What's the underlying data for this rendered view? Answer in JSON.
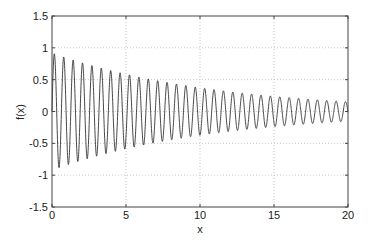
{
  "chart_data": {
    "type": "line",
    "title": "",
    "xlabel": "x",
    "ylabel": "f(x)",
    "xlim": [
      0,
      20
    ],
    "ylim": [
      -1.5,
      1.5
    ],
    "xticks": [
      0,
      5,
      10,
      15,
      20
    ],
    "yticks": [
      -1.5,
      -1,
      -0.5,
      0,
      0.5,
      1,
      1.5
    ],
    "xtick_labels": [
      "0",
      "5",
      "10",
      "15",
      "20"
    ],
    "ytick_labels": [
      "-1.5",
      "-1",
      "-0.5",
      "0",
      "0.5",
      "1",
      "1.5"
    ],
    "grid": true,
    "grid_style": "dotted",
    "legend": null,
    "series": [
      {
        "name": "f(x)",
        "description": "exponentially decaying sinusoid",
        "model": {
          "amplitude": 0.92,
          "decay_rate": 0.09,
          "angular_frequency": 9.9,
          "phase": 0
        },
        "envelope_samples": {
          "x": [
            0,
            5,
            10,
            15,
            20
          ],
          "amplitude": [
            0.92,
            0.59,
            0.37,
            0.24,
            0.15
          ]
        },
        "color": "#333333"
      }
    ]
  },
  "colors": {
    "line": "#333333",
    "axes": "#444444",
    "grid": "#c8c8c8",
    "background": "#ffffff"
  }
}
